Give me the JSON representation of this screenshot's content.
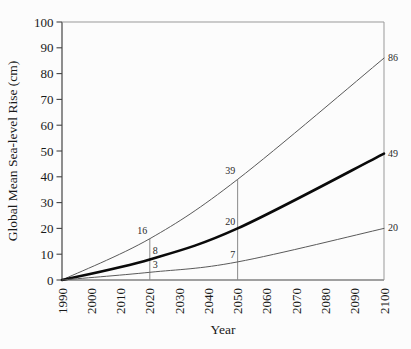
{
  "chart_data": {
    "type": "line",
    "title": "",
    "xlabel": "Year",
    "ylabel": "Global Mean Sea-level Rise (cm)",
    "xlim": [
      1990,
      2100
    ],
    "ylim": [
      0,
      100
    ],
    "x_ticks": [
      1990,
      2000,
      2010,
      2020,
      2030,
      2040,
      2050,
      2060,
      2070,
      2080,
      2090,
      2100
    ],
    "y_ticks": [
      0,
      10,
      20,
      30,
      40,
      50,
      60,
      70,
      80,
      90,
      100
    ],
    "grid": false,
    "legend": "none",
    "series": [
      {
        "name": "high-estimate",
        "x": [
          1990,
          2020,
          2050,
          2100
        ],
        "values": [
          0,
          16,
          39,
          86
        ],
        "color": "#5a5a5a",
        "width": 1
      },
      {
        "name": "mid-estimate",
        "x": [
          1990,
          2020,
          2050,
          2100
        ],
        "values": [
          0,
          8,
          20,
          49
        ],
        "color": "#0a0a0a",
        "width": 2.6
      },
      {
        "name": "low-estimate",
        "x": [
          1990,
          2020,
          2050,
          2100
        ],
        "values": [
          0,
          3,
          7,
          20
        ],
        "color": "#5a5a5a",
        "width": 1
      }
    ],
    "marker_lines": [
      {
        "year": 2020,
        "top": 16
      },
      {
        "year": 2050,
        "top": 39
      }
    ],
    "point_labels": [
      {
        "text": "16",
        "year": 2020,
        "value": 16,
        "side": "left",
        "dy": -5
      },
      {
        "text": "8",
        "year": 2020,
        "value": 8,
        "side": "right",
        "dy": -5
      },
      {
        "text": "3",
        "year": 2020,
        "value": 3,
        "side": "right",
        "dy": -4
      },
      {
        "text": "39",
        "year": 2050,
        "value": 39,
        "side": "left",
        "dy": -5
      },
      {
        "text": "20",
        "year": 2050,
        "value": 20,
        "side": "left",
        "dy": -3
      },
      {
        "text": "7",
        "year": 2050,
        "value": 7,
        "side": "left",
        "dy": -4
      },
      {
        "text": "86",
        "year": 2100,
        "value": 86,
        "side": "outside-right",
        "dy": 3
      },
      {
        "text": "49",
        "year": 2100,
        "value": 49,
        "side": "outside-right",
        "dy": 3
      },
      {
        "text": "20",
        "year": 2100,
        "value": 20,
        "side": "outside-right",
        "dy": 3
      }
    ],
    "colors": {
      "spine_dark": "#444444",
      "spine_light": "#999999",
      "marker_line": "#8a8a8a",
      "background": "#fcfcfc"
    }
  }
}
